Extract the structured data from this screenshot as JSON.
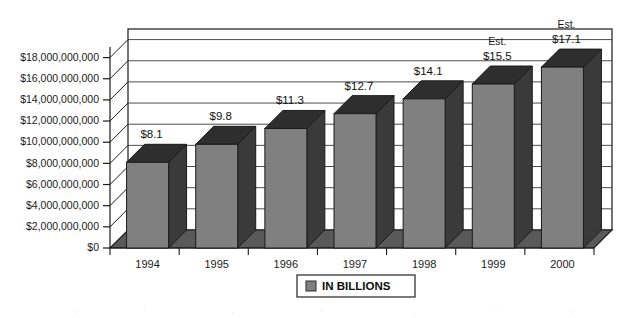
{
  "chart_data": {
    "type": "bar",
    "title": "",
    "subtitle": "",
    "xlabel": "",
    "ylabel": "",
    "categories": [
      "1994",
      "1995",
      "1996",
      "1997",
      "1998",
      "1999",
      "2000"
    ],
    "values": [
      8.1,
      9.8,
      11.3,
      12.7,
      14.1,
      15.5,
      17.1
    ],
    "value_labels": [
      "$8.1",
      "$9.8",
      "$11.3",
      "$12.7",
      "$14.1",
      "$15.5",
      "$17.1"
    ],
    "point_notes": [
      "",
      "",
      "",
      "",
      "",
      "Est.",
      "Est."
    ],
    "units": "billions of dollars",
    "ylim": [
      0,
      19000000000
    ],
    "ytick_values": [
      0,
      2000000000,
      4000000000,
      6000000000,
      8000000000,
      10000000000,
      12000000000,
      14000000000,
      16000000000,
      18000000000
    ],
    "ytick_labels": [
      "$0",
      "$2,000,000,000",
      "$4,000,000,000",
      "$6,000,000,000",
      "$8,000,000,000",
      "$10,000,000,000",
      "$12,000,000,000",
      "$14,000,000,000",
      "$16,000,000,000",
      "$18,000,000,000"
    ],
    "grid": true,
    "three_d": true,
    "legend_position": "bottom-center",
    "legend": [
      {
        "label": "IN BILLIONS",
        "color": "#808080"
      }
    ]
  },
  "style": {
    "bar_front_color": "#808080",
    "bar_side_color": "#3a3a3a",
    "bar_top_color": "#2e2e2e",
    "floor_color": "#595959",
    "wall_color": "#ffffff",
    "outline_color": "#1a1a1a",
    "grid_color": "#4d4d4d",
    "text_color": "#1a1a1a"
  }
}
